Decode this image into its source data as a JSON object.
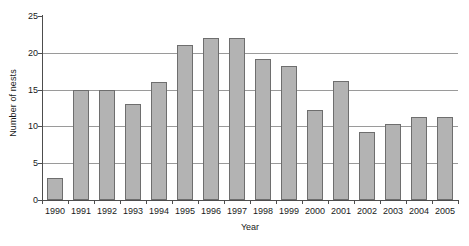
{
  "chart_data": {
    "type": "bar",
    "title": "",
    "xlabel": "Year",
    "ylabel": "Number of nests",
    "categories": [
      "1990",
      "1991",
      "1992",
      "1993",
      "1994",
      "1995",
      "1996",
      "1997",
      "1998",
      "1999",
      "2000",
      "2001",
      "2002",
      "2003",
      "2004",
      "2005"
    ],
    "values": [
      3,
      15,
      15,
      13,
      16,
      21,
      22,
      22,
      19.1,
      18.2,
      12.2,
      16.2,
      9.3,
      10.3,
      11.3,
      11.3
    ],
    "ylim": [
      0,
      25
    ],
    "yticks": [
      0,
      5,
      10,
      15,
      20,
      25
    ],
    "ytick_labels": [
      "0",
      "5",
      "10",
      "15",
      "20",
      "25"
    ],
    "grid": true,
    "grid_axis": "y",
    "legend": false,
    "legend_position": "none",
    "series": [
      {
        "name": "Number of nests",
        "values": [
          3,
          15,
          15,
          13,
          16,
          21,
          22,
          22,
          19.1,
          18.2,
          12.2,
          16.2,
          9.3,
          10.3,
          11.3,
          11.3
        ]
      }
    ]
  },
  "colors": {
    "bar_fill": "#b3b3b3",
    "bar_stroke": "#6e6e6e",
    "gridline": "#9a9a9a",
    "axis": "#4d4d4d",
    "background": "#ffffff",
    "text": "#1a1a1a"
  }
}
